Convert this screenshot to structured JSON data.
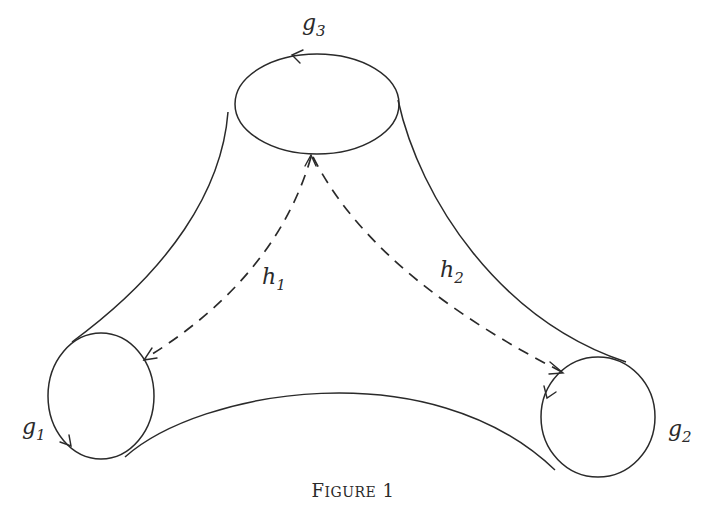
{
  "figure": {
    "caption": {
      "lead": "F",
      "smallcaps": "IGURE",
      "number": "1"
    },
    "boundaries": [
      {
        "id": "g3",
        "base": "g",
        "subscript": "3",
        "center": [
          317,
          104
        ],
        "rx": 82,
        "ry": 50
      },
      {
        "id": "g1",
        "base": "g",
        "subscript": "1",
        "center": [
          101,
          396
        ],
        "rx": 53,
        "ry": 63
      },
      {
        "id": "g2",
        "base": "g",
        "subscript": "2",
        "center": [
          598,
          417
        ],
        "rx": 57,
        "ry": 60
      }
    ],
    "arcs": [
      {
        "id": "h1",
        "base": "h",
        "subscript": "1",
        "from": "g3",
        "to": "g1",
        "style": "dashed"
      },
      {
        "id": "h2",
        "base": "h",
        "subscript": "2",
        "from": "g3",
        "to": "g2",
        "style": "dashed"
      }
    ],
    "stroke_color": "#2a2a2a",
    "background": "#ffffff"
  }
}
